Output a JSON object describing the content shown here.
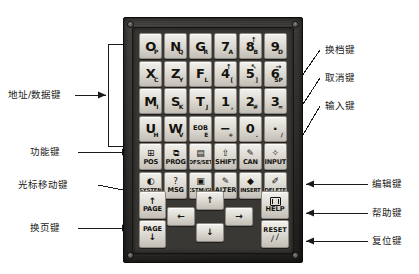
{
  "labels_left": [
    {
      "id": "address-data-keys",
      "text": "地址/数据键"
    },
    {
      "id": "function-keys",
      "text": "功能键"
    },
    {
      "id": "cursor-move-keys",
      "text": "光标移动键"
    },
    {
      "id": "page-keys",
      "text": "换页键"
    }
  ],
  "labels_right": [
    {
      "id": "shift-key",
      "text": "换档键"
    },
    {
      "id": "cancel-key",
      "text": "取消键"
    },
    {
      "id": "input-key",
      "text": "输入键"
    },
    {
      "id": "edit-keys",
      "text": "编辑键"
    },
    {
      "id": "help-key",
      "text": "帮助键"
    },
    {
      "id": "reset-key",
      "text": "复位键"
    }
  ],
  "keypad": {
    "address_data_rows": [
      [
        {
          "main": "O",
          "sub": "P"
        },
        {
          "main": "N",
          "sub": "Q"
        },
        {
          "main": "G",
          "sub": "R"
        },
        {
          "main": "7",
          "sub": "A"
        },
        {
          "main": "8",
          "sub": "B",
          "up": "↑"
        },
        {
          "main": "9",
          "sub": "D"
        }
      ],
      [
        {
          "main": "X",
          "sub": "C"
        },
        {
          "main": "Z",
          "sub": "Y"
        },
        {
          "main": "F",
          "sub": "L"
        },
        {
          "main": "4",
          "sub": "[",
          "up": "↑"
        },
        {
          "main": "5",
          "sub": "]",
          "up": "↖"
        },
        {
          "main": "6",
          "sub": "SP",
          "up": "→"
        }
      ],
      [
        {
          "main": "M",
          "sub": "I"
        },
        {
          "main": "S",
          "sub": "K"
        },
        {
          "main": "T",
          "sub": "J"
        },
        {
          "main": "1",
          "sub": ","
        },
        {
          "main": "2",
          "sub": "#"
        },
        {
          "main": "3",
          "sub": "="
        }
      ],
      [
        {
          "main": "U",
          "sub": "H"
        },
        {
          "main": "W",
          "sub": "V"
        },
        {
          "main": "EOB",
          "sub": "E",
          "small": true
        },
        {
          "main": "−",
          "sub": "+"
        },
        {
          "main": "0",
          "sub": "."
        },
        {
          "main": "·",
          "sub": "/"
        }
      ]
    ],
    "function_row": [
      {
        "icon": "position-icon",
        "glyph": "⊞",
        "label": "POS",
        "big": true
      },
      {
        "icon": "program-icon",
        "glyph": "⧉",
        "label": "PROG",
        "big": true
      },
      {
        "icon": "offset-icon",
        "glyph": "▤",
        "label": "OFS/SET",
        "big": false
      },
      {
        "icon": "shift-icon",
        "glyph": "⇧",
        "label": "SHIFT",
        "big": true
      },
      {
        "icon": "cancel-icon",
        "glyph": "✎",
        "label": "CAN",
        "big": true
      },
      {
        "icon": "input-icon",
        "glyph": "✧",
        "label": "INPUT",
        "big": true
      }
    ],
    "edit_row": [
      {
        "icon": "system-icon",
        "glyph": "◐",
        "label": "SYSTEM",
        "big": false
      },
      {
        "icon": "message-icon",
        "glyph": "?",
        "label": "MSG",
        "big": true
      },
      {
        "icon": "graph-icon",
        "glyph": "▣",
        "label": "CSTM/GR",
        "big": false
      },
      {
        "icon": "alter-icon",
        "glyph": "✎",
        "label": "ALTER",
        "big": true
      },
      {
        "icon": "insert-icon",
        "glyph": "◆",
        "label": "INSERT",
        "big": false
      },
      {
        "icon": "delete-icon",
        "glyph": "✐",
        "label": "DELETE",
        "big": false
      }
    ],
    "page_keys": [
      {
        "id": "page-up-key",
        "arrow": "↑",
        "text": "PAGE",
        "arrow_first": true
      },
      {
        "id": "page-down-key",
        "arrow": "↓",
        "text": "PAGE",
        "arrow_first": false
      }
    ],
    "cursor_keys": [
      {
        "id": "cursor-left-key",
        "arrow": "←"
      },
      {
        "id": "cursor-up-key",
        "arrow": "↑"
      },
      {
        "id": "cursor-down-key",
        "arrow": "↓"
      },
      {
        "id": "cursor-right-key",
        "arrow": "→"
      }
    ],
    "utility_keys": [
      {
        "id": "help-key-button",
        "label": "HELP",
        "icon": "monitor-icon"
      },
      {
        "id": "reset-key-button",
        "label": "RESET",
        "icon": "eraser-icon"
      }
    ]
  },
  "colors": {
    "panel": "#2e2c29",
    "inner": "#3a3835",
    "key_face": "#e6e3dc",
    "text": "#14130f",
    "leader": "#1a1a1a"
  }
}
